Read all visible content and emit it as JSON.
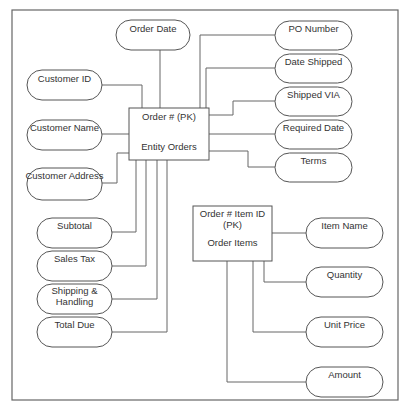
{
  "diagram": {
    "type": "entity-relationship",
    "entities": {
      "orders": {
        "key_label": "Order # (PK)",
        "name_label": "Entity Orders"
      },
      "order_items": {
        "key_label_line1": "Order # Item ID",
        "key_label_line2": "(PK)",
        "name_label": "Order Items"
      }
    },
    "order_attributes": {
      "order_date": "Order Date",
      "customer_id": "Customer ID",
      "customer_name": "Customer Name",
      "customer_address": "Customer Address",
      "po_number": "PO Number",
      "date_shipped": "Date Shipped",
      "shipped_via": "Shipped VIA",
      "required_date": "Required Date",
      "terms": "Terms",
      "subtotal": "Subtotal",
      "sales_tax": "Sales Tax",
      "shipping_handling_line1": "Shipping &",
      "shipping_handling_line2": "Handling",
      "total_due": "Total Due"
    },
    "item_attributes": {
      "item_name": "Item Name",
      "quantity": "Quantity",
      "unit_price": "Unit Price",
      "amount": "Amount"
    },
    "colors": {
      "line": "#666666",
      "text": "#333333",
      "background": "#ffffff"
    }
  }
}
